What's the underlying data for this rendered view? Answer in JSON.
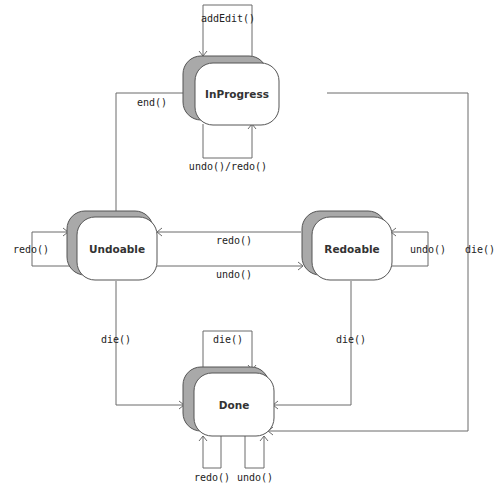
{
  "diagram": {
    "type": "state-machine",
    "states": [
      {
        "id": "inprogress",
        "label": "InProgress"
      },
      {
        "id": "undoable",
        "label": "Undoable"
      },
      {
        "id": "redoable",
        "label": "Redoable"
      },
      {
        "id": "done",
        "label": "Done"
      }
    ],
    "transitions": [
      {
        "from": "inprogress",
        "to": "inprogress",
        "label": "addEdit()"
      },
      {
        "from": "inprogress",
        "to": "inprogress",
        "label": "undo()/redo()"
      },
      {
        "from": "inprogress",
        "to": "undoable",
        "label": "end()"
      },
      {
        "from": "inprogress",
        "to": "done",
        "label": "die()"
      },
      {
        "from": "undoable",
        "to": "undoable",
        "label": "redo()"
      },
      {
        "from": "undoable",
        "to": "redoable",
        "label": "undo()"
      },
      {
        "from": "redoable",
        "to": "undoable",
        "label": "redo()"
      },
      {
        "from": "redoable",
        "to": "redoable",
        "label": "undo()"
      },
      {
        "from": "undoable",
        "to": "done",
        "label": "die()"
      },
      {
        "from": "redoable",
        "to": "done",
        "label": "die()"
      },
      {
        "from": "done",
        "to": "done",
        "label": "die()"
      },
      {
        "from": "done",
        "to": "done",
        "label": "redo()"
      },
      {
        "from": "done",
        "to": "done",
        "label": "undo()"
      }
    ]
  }
}
